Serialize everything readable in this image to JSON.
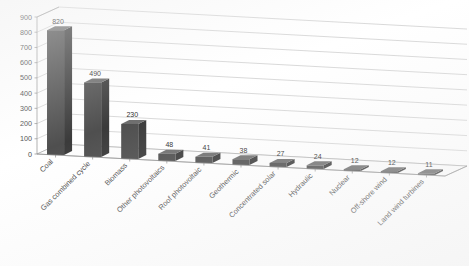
{
  "chart_data": {
    "type": "bar",
    "title": "",
    "xlabel": "",
    "ylabel": "",
    "ylim": [
      0,
      900
    ],
    "ytick_step": 100,
    "grid": true,
    "legend": "none",
    "style": "3d-column",
    "bar_color": "#4f4f4f",
    "categories": [
      "Coal",
      "Gas combined cycle",
      "Biomass",
      "Other photovoltaics",
      "Roof photovoltaic",
      "Geothermic",
      "Concentrated solar",
      "Hydraulic",
      "Nuclear",
      "Off-shore wind",
      "Land wind turbines"
    ],
    "values": [
      820,
      490,
      230,
      48,
      41,
      38,
      27,
      24,
      12,
      12,
      11
    ],
    "yticks": [
      "0",
      "100",
      "200",
      "300",
      "400",
      "500",
      "600",
      "700",
      "800",
      "900"
    ],
    "data_labels": [
      "820",
      "490",
      "230",
      "48",
      "41",
      "38",
      "27",
      "24",
      "12",
      "12",
      "11"
    ]
  }
}
